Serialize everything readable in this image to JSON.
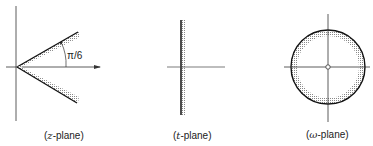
{
  "figure": {
    "panels": [
      {
        "id": "z",
        "caption_prefix": "(",
        "caption_var": "z",
        "caption_suffix": "-plane)",
        "annotation": "π/6"
      },
      {
        "id": "t",
        "caption_prefix": "(",
        "caption_var": "t",
        "caption_suffix": "-plane)"
      },
      {
        "id": "w",
        "caption_prefix": "(",
        "caption_var": "ω",
        "caption_suffix": "-plane)"
      }
    ],
    "colors": {
      "line": "#222222",
      "hatch": "#9a9a9a",
      "background": "#ffffff"
    }
  }
}
